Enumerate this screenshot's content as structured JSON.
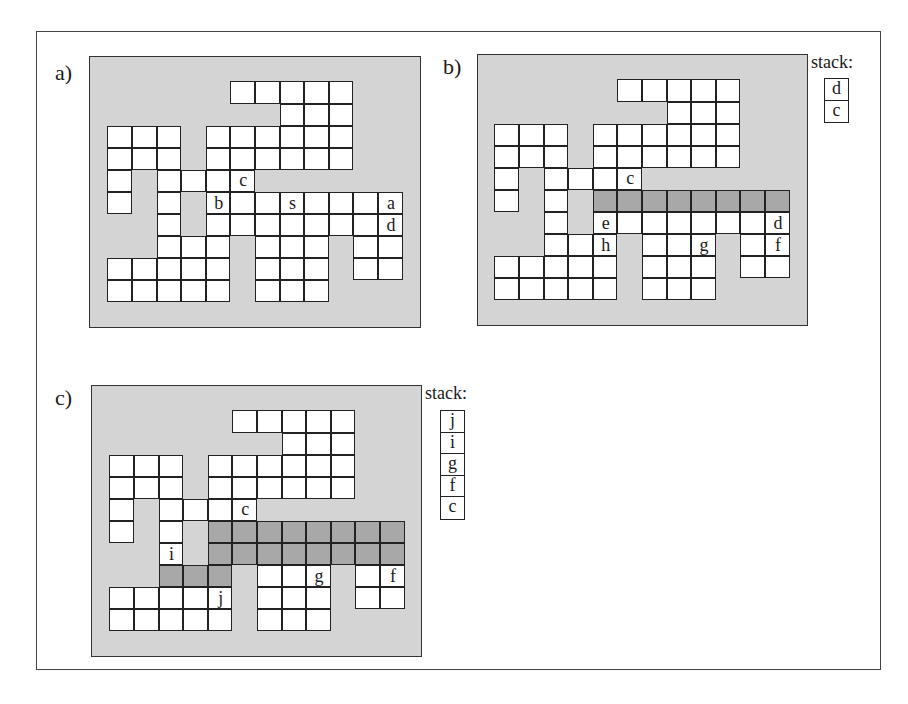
{
  "figure": {
    "colors": {
      "background": "#d4d4d4",
      "empty_cell": "#ffffff",
      "filled_cell": "#a8a8a8",
      "lines": "#222222"
    },
    "grid": {
      "rows": 10,
      "cols": 12,
      "open_cells_by_row": [
        [
          5,
          6,
          7,
          8,
          9
        ],
        [
          7,
          8,
          9
        ],
        [
          0,
          1,
          2,
          4,
          5,
          6,
          7,
          8,
          9
        ],
        [
          0,
          1,
          2,
          4,
          5,
          6,
          7,
          8,
          9
        ],
        [
          0,
          2,
          3,
          4,
          5
        ],
        [
          0,
          2,
          4,
          5,
          6,
          7,
          8,
          9,
          10,
          11
        ],
        [
          2,
          4,
          5,
          6,
          7,
          8,
          9,
          10,
          11
        ],
        [
          2,
          3,
          4,
          6,
          7,
          8,
          10,
          11
        ],
        [
          0,
          1,
          2,
          3,
          4,
          6,
          7,
          8,
          10,
          11
        ],
        [
          0,
          1,
          2,
          3,
          4,
          6,
          7,
          8
        ]
      ]
    }
  },
  "panels": [
    {
      "id": "a",
      "label": "a)",
      "label_pos": [
        55,
        62
      ],
      "board": {
        "left": 89,
        "top": 56,
        "width": 332,
        "height": 272
      },
      "origin": [
        108,
        82
      ],
      "filled": [],
      "labels": [
        {
          "text": "c",
          "row": 4,
          "col": 5
        },
        {
          "text": "b",
          "row": 5,
          "col": 4
        },
        {
          "text": "s",
          "row": 5,
          "col": 7
        },
        {
          "text": "a",
          "row": 5,
          "col": 11
        },
        {
          "text": "d",
          "row": 6,
          "col": 11
        }
      ],
      "stack": null
    },
    {
      "id": "b",
      "label": "b)",
      "label_pos": [
        443,
        56
      ],
      "board": {
        "left": 477,
        "top": 54,
        "width": 331,
        "height": 272
      },
      "origin": [
        495,
        80
      ],
      "filled": [
        {
          "row": 5,
          "cols": [
            4,
            5,
            6,
            7,
            8,
            9,
            10,
            11
          ]
        }
      ],
      "labels": [
        {
          "text": "c",
          "row": 4,
          "col": 5
        },
        {
          "text": "e",
          "row": 6,
          "col": 4
        },
        {
          "text": "d",
          "row": 6,
          "col": 11
        },
        {
          "text": "h",
          "row": 7,
          "col": 4
        },
        {
          "text": "g",
          "row": 7,
          "col": 8
        },
        {
          "text": "f",
          "row": 7,
          "col": 11
        }
      ],
      "stack": {
        "title": "stack:",
        "title_pos": [
          811,
          53
        ],
        "box_pos": [
          824,
          78
        ],
        "items": [
          "d",
          "c"
        ]
      }
    },
    {
      "id": "c",
      "label": "c)",
      "label_pos": [
        55,
        387
      ],
      "board": {
        "left": 91,
        "top": 385,
        "width": 331,
        "height": 272
      },
      "origin": [
        110,
        411
      ],
      "filled": [
        {
          "row": 5,
          "cols": [
            4,
            5,
            6,
            7,
            8,
            9,
            10,
            11
          ]
        },
        {
          "row": 6,
          "cols": [
            4,
            5,
            6,
            7,
            8,
            9,
            10,
            11
          ]
        },
        {
          "row": 7,
          "cols": [
            2,
            3,
            4
          ]
        }
      ],
      "labels": [
        {
          "text": "c",
          "row": 4,
          "col": 5
        },
        {
          "text": "i",
          "row": 6,
          "col": 2
        },
        {
          "text": "g",
          "row": 7,
          "col": 8
        },
        {
          "text": "f",
          "row": 7,
          "col": 11
        },
        {
          "text": "j",
          "row": 8,
          "col": 4
        }
      ],
      "stack": {
        "title": "stack:",
        "title_pos": [
          425,
          384
        ],
        "box_pos": [
          440,
          410
        ],
        "items": [
          "j",
          "i",
          "g",
          "f",
          "c"
        ]
      }
    }
  ]
}
